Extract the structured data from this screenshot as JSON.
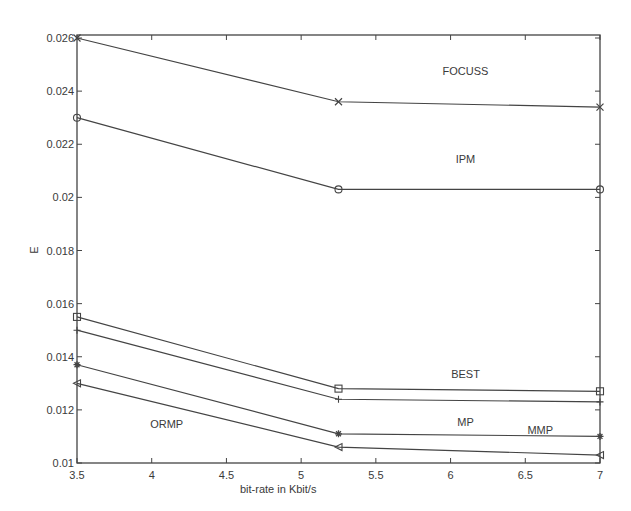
{
  "chart_data": {
    "type": "line",
    "title": "",
    "xlabel": "bit-rate in Kbit/s",
    "ylabel": "E",
    "xlim": [
      3.5,
      7
    ],
    "ylim": [
      0.01,
      0.026
    ],
    "grid": false,
    "legend": "inline labels",
    "x": [
      3.5,
      5.25,
      7
    ],
    "x_ticks": [
      "3.5",
      "4",
      "4.5",
      "5",
      "5.5",
      "6",
      "6.5",
      "7"
    ],
    "y_ticks": [
      "0.01",
      "0.012",
      "0.014",
      "0.016",
      "0.018",
      "0.02",
      "0.022",
      "0.024",
      "0.026"
    ],
    "series": [
      {
        "name": "FOCUSS",
        "marker": "x",
        "values": [
          0.026,
          0.0236,
          0.0234
        ]
      },
      {
        "name": "IPM",
        "marker": "o",
        "values": [
          0.023,
          0.0203,
          0.0203
        ]
      },
      {
        "name": "BEST",
        "marker": "square",
        "values": [
          0.0155,
          0.0128,
          0.0127
        ]
      },
      {
        "name": "MMP",
        "marker": "+",
        "values": [
          0.015,
          0.0124,
          0.0123
        ]
      },
      {
        "name": "MP",
        "marker": "*",
        "values": [
          0.0137,
          0.0111,
          0.011
        ]
      },
      {
        "name": "ORMP",
        "marker": "triangle-left",
        "values": [
          0.013,
          0.0106,
          0.0103
        ]
      }
    ],
    "annotations": [
      {
        "text": "FOCUSS",
        "x": 6.1,
        "y": 0.0246
      },
      {
        "text": "IPM",
        "x": 6.1,
        "y": 0.0213
      },
      {
        "text": "BEST",
        "x": 6.1,
        "y": 0.0132
      },
      {
        "text": "MP",
        "x": 6.1,
        "y": 0.0114
      },
      {
        "text": "MMP",
        "x": 6.6,
        "y": 0.0111
      },
      {
        "text": "ORMP",
        "x": 4.1,
        "y": 0.0113
      }
    ]
  }
}
